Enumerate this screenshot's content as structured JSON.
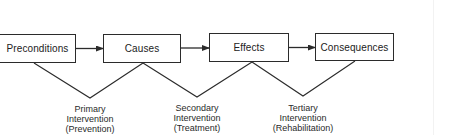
{
  "diagram": {
    "type": "flow",
    "stages": [
      {
        "id": "preconditions",
        "label": "Preconditions"
      },
      {
        "id": "causes",
        "label": "Causes"
      },
      {
        "id": "effects",
        "label": "Effects"
      },
      {
        "id": "consequences",
        "label": "Consequences"
      }
    ],
    "arrows": [
      {
        "from": "preconditions",
        "to": "causes"
      },
      {
        "from": "causes",
        "to": "effects"
      },
      {
        "from": "effects",
        "to": "consequences"
      }
    ],
    "interventions": [
      {
        "id": "primary",
        "spans": [
          "preconditions",
          "causes"
        ],
        "lines": [
          "Primary",
          "Intervention",
          "(Prevention)"
        ]
      },
      {
        "id": "secondary",
        "spans": [
          "causes",
          "effects"
        ],
        "lines": [
          "Secondary",
          "Intervention",
          "(Treatment)"
        ]
      },
      {
        "id": "tertiary",
        "spans": [
          "effects",
          "consequences"
        ],
        "lines": [
          "Tertiary",
          "Intervention",
          "(Rehabilitation)"
        ]
      }
    ],
    "line_color": "#2b2b2b"
  }
}
